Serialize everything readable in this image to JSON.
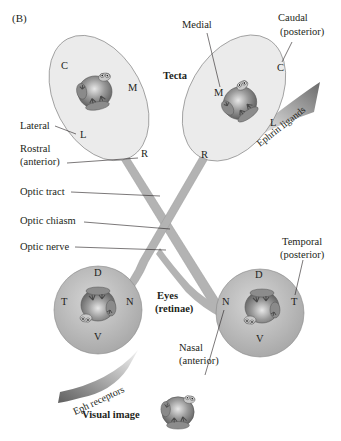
{
  "panel_label": "(B)",
  "tecta": {
    "title": "Tecta",
    "left": {
      "C": "C",
      "M": "M",
      "L": "L",
      "R": "R"
    },
    "right": {
      "C": "C",
      "M": "M",
      "L": "L",
      "R": "R"
    }
  },
  "labels": {
    "caudal_line1": "Caudal",
    "caudal_line2": "(posterior)",
    "medial": "Medial",
    "lateral": "Lateral",
    "rostral_line1": "Rostral",
    "rostral_line2": "(anterior)",
    "optic_tract": "Optic tract",
    "optic_chiasm": "Optic chiasm",
    "optic_nerve": "Optic nerve",
    "temporal_line1": "Temporal",
    "temporal_line2": "(posterior)",
    "nasal_line1": "Nasal",
    "nasal_line2": "(anterior)",
    "eyes_line1": "Eyes",
    "eyes_line2": "(retinae)",
    "ephrin_ligands": "Ephrin ligands",
    "eph_receptors": "Eph receptors",
    "visual_image": "Visual image"
  },
  "eyes": {
    "left": {
      "D": "D",
      "V": "V",
      "T": "T",
      "N": "N"
    },
    "right": {
      "D": "D",
      "V": "V",
      "T": "T",
      "N": "N"
    }
  },
  "colors": {
    "tectum_fill": "#ebebeb",
    "eye_fill": "#b9b9b9",
    "nerve_fill": "#b3b3b3",
    "gradient_dark": "#6d6d6d",
    "text": "#231f20"
  }
}
